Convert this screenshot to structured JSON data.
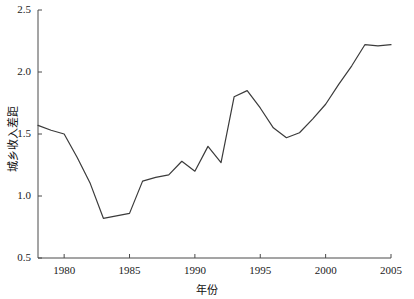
{
  "chart_data": {
    "type": "line",
    "title": "",
    "xlabel": "年份",
    "ylabel": "城乡收入差距",
    "xlim": [
      1978,
      2005
    ],
    "ylim": [
      0.5,
      2.5
    ],
    "grid": false,
    "legend": null,
    "xticks": [
      "1980",
      "1985",
      "1990",
      "1995",
      "2000",
      "2005"
    ],
    "xtick_values": [
      1980,
      1985,
      1990,
      1995,
      2000,
      2005
    ],
    "yticks": [
      "0.5",
      "1.0",
      "1.5",
      "2.0",
      "2.5"
    ],
    "ytick_values": [
      0.5,
      1.0,
      1.5,
      2.0,
      2.5
    ],
    "line_color": "#3b3b3b",
    "line_width": 1.2,
    "x": [
      1978,
      1979,
      1980,
      1981,
      1982,
      1983,
      1984,
      1985,
      1986,
      1987,
      1988,
      1989,
      1990,
      1991,
      1992,
      1993,
      1994,
      1995,
      1996,
      1997,
      1998,
      1999,
      2000,
      2001,
      2002,
      2003,
      2004,
      2005
    ],
    "values": [
      1.57,
      1.53,
      1.5,
      1.31,
      1.1,
      0.82,
      0.84,
      0.86,
      1.12,
      1.15,
      1.17,
      1.28,
      1.2,
      1.4,
      1.27,
      1.8,
      1.85,
      1.71,
      1.55,
      1.47,
      1.51,
      1.62,
      1.74,
      1.9,
      2.05,
      2.22,
      2.21,
      2.22
    ],
    "series": [
      {
        "name": "城乡收入差距",
        "values": [
          1.57,
          1.53,
          1.5,
          1.31,
          1.1,
          0.82,
          0.84,
          0.86,
          1.12,
          1.15,
          1.17,
          1.28,
          1.2,
          1.4,
          1.27,
          1.8,
          1.85,
          1.71,
          1.55,
          1.47,
          1.51,
          1.62,
          1.74,
          1.9,
          2.05,
          2.22,
          2.21,
          2.22
        ]
      }
    ]
  },
  "axes": {
    "y_title": "城乡收入差距",
    "x_title": "年份"
  }
}
